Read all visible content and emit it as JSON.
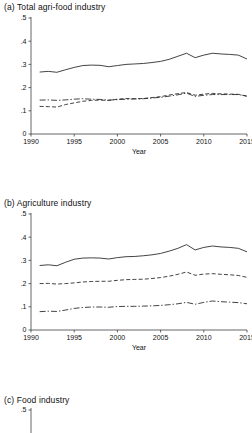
{
  "figure": {
    "axis_color": "#3f3f3f",
    "line_color": "#222222",
    "panels": [
      {
        "id": "a",
        "title": "(a)  Total agri-food industry",
        "has_axes": true,
        "xlabel": "Year",
        "legend": {
          "gvc": "GVC",
          "backward": "GVC backward",
          "forward": "GVC forward"
        }
      },
      {
        "id": "b",
        "title": "(b)  Agriculture industry",
        "has_axes": true,
        "xlabel": "Year",
        "legend": {
          "gvc": "GVC",
          "backward": "GVC backward",
          "forward": "GVC forward"
        }
      },
      {
        "id": "c",
        "title": "(c)  Food industry",
        "has_axes": false,
        "xlabel": "",
        "legend": null
      }
    ]
  },
  "chart_data": [
    {
      "type": "line",
      "title": "(a)  Total agri-food industry",
      "xlabel": "Year",
      "ylabel": "",
      "xlim": [
        1990,
        2015
      ],
      "ylim": [
        0,
        0.5
      ],
      "xticks": [
        1990,
        1995,
        2000,
        2005,
        2010,
        2015
      ],
      "yticks": [
        0,
        0.1,
        0.2,
        0.3,
        0.4,
        0.5
      ],
      "ytick_labels": [
        "0",
        ".1",
        ".2",
        ".3",
        ".4",
        ".5"
      ],
      "grid": false,
      "legend_position": "below-axis",
      "x": [
        1991,
        1992,
        1993,
        1994,
        1995,
        1996,
        1997,
        1998,
        1999,
        2000,
        2001,
        2002,
        2003,
        2004,
        2005,
        2006,
        2007,
        2008,
        2009,
        2010,
        2011,
        2012,
        2013,
        2014,
        2015
      ],
      "series": [
        {
          "name": "GVC",
          "style": "solid",
          "values": [
            0.267,
            0.27,
            0.266,
            0.277,
            0.287,
            0.295,
            0.297,
            0.296,
            0.29,
            0.295,
            0.3,
            0.302,
            0.304,
            0.308,
            0.313,
            0.322,
            0.335,
            0.348,
            0.329,
            0.34,
            0.348,
            0.345,
            0.343,
            0.34,
            0.323
          ]
        },
        {
          "name": "GVC backward",
          "style": "dashed",
          "values": [
            0.119,
            0.118,
            0.116,
            0.127,
            0.134,
            0.141,
            0.145,
            0.146,
            0.145,
            0.15,
            0.153,
            0.152,
            0.153,
            0.157,
            0.161,
            0.168,
            0.174,
            0.179,
            0.167,
            0.172,
            0.175,
            0.173,
            0.172,
            0.171,
            0.163
          ]
        },
        {
          "name": "GVC forward",
          "style": "dashdot",
          "values": [
            0.146,
            0.147,
            0.145,
            0.147,
            0.15,
            0.152,
            0.15,
            0.149,
            0.146,
            0.148,
            0.15,
            0.151,
            0.152,
            0.155,
            0.158,
            0.163,
            0.169,
            0.176,
            0.162,
            0.167,
            0.17,
            0.17,
            0.17,
            0.17,
            0.163
          ]
        }
      ]
    },
    {
      "type": "line",
      "title": "(b)  Agriculture industry",
      "xlabel": "Year",
      "ylabel": "",
      "xlim": [
        1990,
        2015
      ],
      "ylim": [
        0,
        0.5
      ],
      "xticks": [
        1990,
        1995,
        2000,
        2005,
        2010,
        2015
      ],
      "yticks": [
        0,
        0.1,
        0.2,
        0.3,
        0.4,
        0.5
      ],
      "ytick_labels": [
        "0",
        ".1",
        ".2",
        ".3",
        ".4",
        ".5"
      ],
      "grid": false,
      "legend_position": "below-axis",
      "x": [
        1991,
        1992,
        1993,
        1994,
        1995,
        1996,
        1997,
        1998,
        1999,
        2000,
        2001,
        2002,
        2003,
        2004,
        2005,
        2006,
        2007,
        2008,
        2009,
        2010,
        2011,
        2012,
        2013,
        2014,
        2015
      ],
      "series": [
        {
          "name": "GVC",
          "style": "solid",
          "values": [
            0.278,
            0.281,
            0.277,
            0.292,
            0.305,
            0.31,
            0.311,
            0.31,
            0.306,
            0.312,
            0.316,
            0.317,
            0.32,
            0.324,
            0.33,
            0.34,
            0.352,
            0.368,
            0.345,
            0.356,
            0.362,
            0.358,
            0.356,
            0.352,
            0.337
          ]
        },
        {
          "name": "GVC backward",
          "style": "dashed",
          "values": [
            0.2,
            0.201,
            0.198,
            0.2,
            0.203,
            0.207,
            0.209,
            0.21,
            0.21,
            0.214,
            0.217,
            0.218,
            0.219,
            0.222,
            0.226,
            0.232,
            0.24,
            0.25,
            0.236,
            0.241,
            0.243,
            0.24,
            0.238,
            0.235,
            0.227
          ]
        },
        {
          "name": "GVC forward",
          "style": "dashdot",
          "values": [
            0.079,
            0.081,
            0.08,
            0.086,
            0.093,
            0.097,
            0.099,
            0.099,
            0.098,
            0.101,
            0.102,
            0.102,
            0.103,
            0.104,
            0.106,
            0.109,
            0.113,
            0.119,
            0.111,
            0.119,
            0.125,
            0.122,
            0.12,
            0.118,
            0.113
          ]
        }
      ]
    },
    {
      "type": "line",
      "title": "(c)  Food industry",
      "xlabel": "",
      "ylabel": "",
      "xlim": [
        1990,
        2015
      ],
      "ylim": [
        0,
        0.5
      ],
      "yticks": [
        0.5
      ],
      "ytick_labels": [
        ".5"
      ],
      "grid": false,
      "note": "panel cropped at bottom of image; only title and top y-axis tick visible",
      "x": [],
      "series": []
    }
  ]
}
